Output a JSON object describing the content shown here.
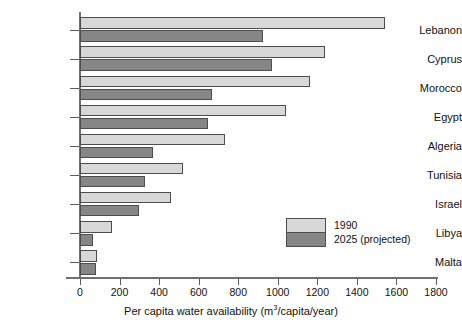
{
  "chart_data": {
    "type": "bar",
    "orientation": "horizontal",
    "title": "",
    "xlabel": "Per capita water availability (m³/capita/year)",
    "xlabel_parts": {
      "before": "Per capita water availability (m",
      "sup": "3",
      "after": "/capita/year)"
    },
    "ylabel": "",
    "categories": [
      "Lebanon",
      "Cyprus",
      "Morocco",
      "Egypt",
      "Algeria",
      "Tunisia",
      "Israel",
      "Libya",
      "Malta"
    ],
    "series": [
      {
        "name": "1990",
        "color": "#d8d8d8",
        "values": [
          1540,
          1240,
          1165,
          1040,
          735,
          520,
          460,
          160,
          85
        ]
      },
      {
        "name": "2025 (projected)",
        "color": "#868686",
        "values": [
          925,
          970,
          665,
          645,
          370,
          330,
          300,
          65,
          80
        ]
      }
    ],
    "xlim": [
      0,
      1800
    ],
    "xticks": [
      0,
      200,
      400,
      600,
      800,
      1000,
      1200,
      1400,
      1600,
      1800
    ],
    "xtick_labels": [
      "0",
      "200",
      "400",
      "600",
      "800",
      "1000",
      "1200",
      "1400",
      "1600",
      "1800"
    ],
    "grid": false,
    "legend_position": "inside-right-lower",
    "legend_entries": [
      "1990",
      "2025 (projected)"
    ]
  },
  "colors": {
    "series_1990": "#d8d8d8",
    "series_2025": "#868686",
    "axis": "#6f6f6f",
    "bar_outline": "#4d4d4d",
    "background": "#ffffff",
    "text": "#111111"
  }
}
